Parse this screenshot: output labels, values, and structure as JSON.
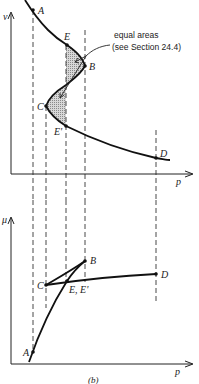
{
  "figure": {
    "caption": "(b)",
    "colors": {
      "ink": "#1a1a1a",
      "shade": "#bdbdbd",
      "background": "#ffffff"
    }
  },
  "top_plot": {
    "y_axis_label": "v",
    "x_axis_label": "p",
    "points": {
      "A": "A",
      "E": "E",
      "B": "B",
      "C": "C",
      "E_prime": "E'",
      "D": "D"
    },
    "annotation": {
      "line1": "equal areas",
      "line2": "(see Section 24.4)"
    }
  },
  "bottom_plot": {
    "y_axis_label": "μ",
    "x_axis_label": "p",
    "points": {
      "A": "A",
      "B": "B",
      "C": "C",
      "E_E_prime": "E, E'",
      "D": "D"
    }
  }
}
